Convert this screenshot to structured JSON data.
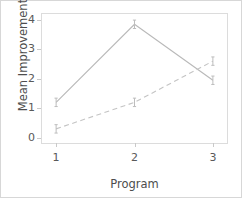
{
  "chart_data": {
    "type": "line",
    "title": "",
    "xlabel": "Program",
    "ylabel": "Mean Improvement",
    "x": [
      1,
      2,
      3
    ],
    "xticklabels": [
      "1",
      "2",
      "3"
    ],
    "yticklabels": [
      "0",
      "1",
      "2",
      "3",
      "4"
    ],
    "yticks": [
      0,
      1,
      2,
      3,
      4
    ],
    "xlim": [
      0.82,
      3.18
    ],
    "ylim": [
      -0.18,
      4.2
    ],
    "grid": false,
    "legend": "none",
    "series": [
      {
        "name": "solid-line",
        "linestyle": "solid",
        "color": "#b9b9b9",
        "marker": "i-beam",
        "values": [
          1.2,
          3.85,
          1.95
        ]
      },
      {
        "name": "dashed-line",
        "linestyle": "dashed",
        "color": "#c4c4c4",
        "marker": "i-beam",
        "values": [
          0.3,
          1.2,
          2.6
        ]
      }
    ]
  },
  "colors": {
    "background": "#ffffff",
    "frame": "#dcdcdc",
    "outer_border": "#d7d7d7",
    "tick_label": "#595959",
    "axis_title": "#4d4d4d",
    "line_solid": "#b9b9b9",
    "line_dashed": "#c4c4c4",
    "marker": "#bdbdbd"
  }
}
